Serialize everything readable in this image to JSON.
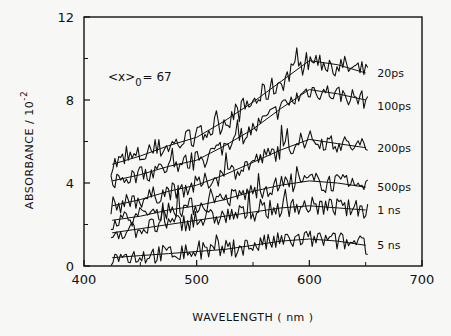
{
  "chart_data": {
    "type": "line",
    "title": "",
    "xlabel": "WAVELENGTH ( nm )",
    "ylabel": "ABSORBANCE / 10",
    "ylabel_exponent": "-2",
    "xlim": [
      400,
      700
    ],
    "ylim": [
      0,
      12
    ],
    "x_ticks": [
      400,
      500,
      600,
      700
    ],
    "x_minor_ticks": [
      450,
      550,
      650
    ],
    "y_ticks": [
      0,
      4,
      8,
      12
    ],
    "y_minor_ticks": [
      2,
      6,
      10
    ],
    "grid": false,
    "annotation": {
      "text_main": "<x>",
      "subscript": "0",
      "text_rest": "= 67"
    },
    "x": [
      425,
      450,
      475,
      500,
      525,
      550,
      575,
      600,
      625,
      650
    ],
    "series": [
      {
        "name": "20ps",
        "values": [
          4.9,
          5.3,
          5.8,
          6.2,
          7.0,
          7.9,
          8.9,
          9.9,
          9.7,
          9.3
        ]
      },
      {
        "name": "100ps",
        "values": [
          4.1,
          4.4,
          4.8,
          5.1,
          5.8,
          6.6,
          7.6,
          8.5,
          8.3,
          8.0
        ]
      },
      {
        "name": "200ps",
        "values": [
          2.9,
          3.2,
          3.6,
          3.9,
          4.4,
          5.0,
          5.6,
          6.1,
          5.9,
          5.7
        ]
      },
      {
        "name": "500ps",
        "values": [
          2.2,
          2.4,
          2.7,
          2.9,
          3.2,
          3.6,
          3.9,
          4.1,
          4.0,
          3.8
        ]
      },
      {
        "name": "1 ns",
        "values": [
          1.6,
          1.8,
          2.0,
          2.2,
          2.4,
          2.6,
          2.8,
          2.9,
          2.8,
          2.7
        ]
      },
      {
        "name": "5 ns",
        "values": [
          0.4,
          0.5,
          0.6,
          0.7,
          0.8,
          1.0,
          1.2,
          1.3,
          1.2,
          1.0
        ]
      }
    ]
  }
}
